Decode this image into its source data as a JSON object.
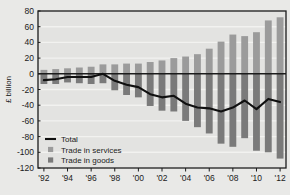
{
  "chart_data": {
    "type": "bar",
    "title": "",
    "xlabel": "",
    "ylabel": "£ billion",
    "ylim": [
      -120,
      80
    ],
    "ytick_step": 20,
    "yticks": [
      80,
      60,
      40,
      20,
      0,
      -20,
      -40,
      -60,
      -80,
      -100,
      -120
    ],
    "ytick_labels": [
      "80",
      "60",
      "40",
      "20",
      "0",
      "-20",
      "-40",
      "-60",
      "-80",
      "-100",
      "-120"
    ],
    "grid": true,
    "grid_axis": "y",
    "categories": [
      "1992",
      "1993",
      "1994",
      "1995",
      "1996",
      "1997",
      "1998",
      "1999",
      "2000",
      "2001",
      "2002",
      "2003",
      "2004",
      "2005",
      "2006",
      "2007",
      "2008",
      "2009",
      "2010",
      "2011",
      "2012"
    ],
    "xtick_labels": [
      "'92",
      "'94",
      "'96",
      "'98",
      "'00",
      "'02",
      "'04",
      "'06",
      "'08",
      "'10",
      "'12"
    ],
    "xtick_years": [
      "1992",
      "1994",
      "1996",
      "1998",
      "2000",
      "2002",
      "2004",
      "2006",
      "2008",
      "2010",
      "2012"
    ],
    "legend_position": "lower-left",
    "series": [
      {
        "name": "Trade in services",
        "kind": "bar",
        "color": "#9b9b9b",
        "values": [
          5,
          6,
          7,
          8,
          9,
          12,
          12,
          13,
          13,
          15,
          17,
          20,
          22,
          25,
          32,
          41,
          50,
          48,
          53,
          68,
          72
        ]
      },
      {
        "name": "Trade in goods",
        "kind": "bar",
        "color": "#7a7a7a",
        "values": [
          -13,
          -13,
          -11,
          -12,
          -13,
          -12,
          -21,
          -27,
          -30,
          -41,
          -47,
          -48,
          -60,
          -68,
          -76,
          -89,
          -93,
          -82,
          -98,
          -100,
          -108
        ]
      },
      {
        "name": "Total",
        "kind": "line",
        "color": "#101010",
        "values": [
          -8,
          -7,
          -4,
          -4,
          -4,
          0,
          -9,
          -14,
          -17,
          -26,
          -30,
          -28,
          -38,
          -43,
          -44,
          -48,
          -43,
          -34,
          -45,
          -32,
          -36
        ]
      }
    ]
  },
  "legend": {
    "items": [
      {
        "label": "Total",
        "marker": "line"
      },
      {
        "label": "Trade in services",
        "marker": "swatch"
      },
      {
        "label": "Trade in goods",
        "marker": "swatch"
      }
    ]
  },
  "colors": {
    "background": "#e9e9e7",
    "plot_background": "#e3e3e1",
    "services_bar": "#9b9b9b",
    "goods_bar": "#7a7a7a",
    "total_line": "#101010",
    "grid": "#f2f2f0",
    "axis": "#1b1b1b"
  }
}
